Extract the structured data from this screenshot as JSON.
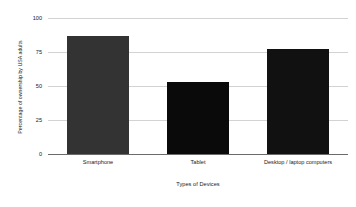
{
  "chart_data": {
    "type": "bar",
    "title": "",
    "subtitle": "",
    "categories": [
      "Smartphone",
      "Tablet",
      "Desktop / laptop computers"
    ],
    "values": [
      87,
      53,
      77
    ],
    "series": [
      {
        "name": "Percentage of ownership by USA adults",
        "values": [
          87,
          53,
          77
        ]
      }
    ],
    "xlabel": "Types of Devices",
    "ylabel": "Percentage of ownership by USA adults",
    "ylim": [
      0,
      100
    ],
    "yticks": [
      0,
      25,
      50,
      75,
      100
    ],
    "ytick_labels": [
      "0",
      "25",
      "50",
      "75",
      "100"
    ],
    "grid": true,
    "grid_axis": "y",
    "legend": false,
    "legend_position": "none",
    "bar_colors": [
      "#333333",
      "#0a0a0a",
      "#111111"
    ],
    "grid_color": "#d2d2d2",
    "axis_color": "#6b6b6b",
    "background_color": "#ffffff",
    "text_color": "#1a1a1a"
  },
  "axis": {
    "y_title": "Percentage of ownership by USA adults",
    "x_title": "Types of Devices",
    "ticks": [
      {
        "label": "100",
        "value": 100
      },
      {
        "label": "75",
        "value": 75
      },
      {
        "label": "50",
        "value": 50
      },
      {
        "label": "25",
        "value": 25
      },
      {
        "label": "0",
        "value": 0
      }
    ]
  },
  "bars": [
    {
      "label": "Smartphone",
      "value": 87
    },
    {
      "label": "Tablet",
      "value": 53
    },
    {
      "label": "Desktop / laptop computers",
      "value": 77
    }
  ]
}
